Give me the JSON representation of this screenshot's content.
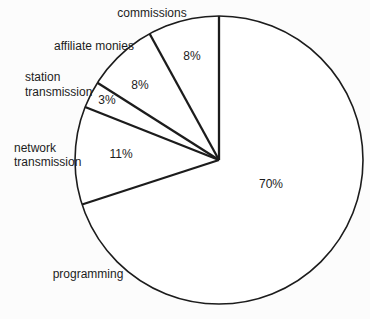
{
  "chart_data": {
    "type": "pie",
    "title": "",
    "direction": "counterclockwise",
    "start_angle_deg": 0,
    "center": {
      "x": 219,
      "y": 160
    },
    "radius": 144,
    "stroke_color": "#1c1c1c",
    "fill_color": "#ffffff",
    "background_color": "#fcfcfc",
    "legend": "none",
    "categories": [
      "commissions",
      "affiliate monies",
      "station transmission",
      "network transmission",
      "programming"
    ],
    "values": [
      8,
      8,
      3,
      11,
      70
    ],
    "slices": [
      {
        "name": "commissions",
        "value": 8,
        "label_anchor": "middle",
        "label_lines": [
          {
            "text": "commissions",
            "x": 152,
            "y": 17
          }
        ],
        "pct_label": {
          "text": "8%",
          "x": 192,
          "y": 60
        }
      },
      {
        "name": "affiliate monies",
        "value": 8,
        "label_anchor": "middle",
        "label_lines": [
          {
            "text": "affiliate monies",
            "x": 94,
            "y": 50
          }
        ],
        "pct_label": {
          "text": "8%",
          "x": 140,
          "y": 89
        }
      },
      {
        "name": "station transmission",
        "value": 3,
        "label_anchor": "start",
        "label_lines": [
          {
            "text": "station",
            "x": 25,
            "y": 81
          },
          {
            "text": "transmission",
            "x": 25,
            "y": 96
          }
        ],
        "pct_label": {
          "text": "3%",
          "x": 107,
          "y": 104
        }
      },
      {
        "name": "network transmission",
        "value": 11,
        "label_anchor": "start",
        "label_lines": [
          {
            "text": "network",
            "x": 14,
            "y": 152
          },
          {
            "text": "transmission",
            "x": 14,
            "y": 166
          }
        ],
        "pct_label": {
          "text": "11%",
          "x": 121,
          "y": 158
        }
      },
      {
        "name": "programming",
        "value": 70,
        "label_anchor": "middle",
        "label_lines": [
          {
            "text": "programming",
            "x": 88,
            "y": 278
          }
        ],
        "pct_label": {
          "text": "70%",
          "x": 271,
          "y": 188
        }
      }
    ]
  }
}
